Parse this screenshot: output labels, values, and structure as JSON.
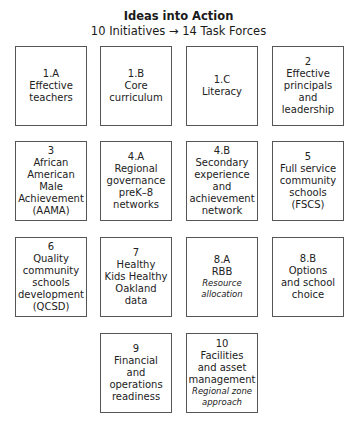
{
  "header": {
    "title": "Ideas into Action",
    "subtitle": "10 Initiatives → 14 Task Forces"
  },
  "boxes": [
    {
      "id": "1.A",
      "lines": [
        "Effective",
        "teachers"
      ],
      "note": []
    },
    {
      "id": "1.B",
      "lines": [
        "Core",
        "curriculum"
      ],
      "note": []
    },
    {
      "id": "1.C",
      "lines": [
        "Literacy"
      ],
      "note": []
    },
    {
      "id": "2",
      "lines": [
        "Effective",
        "principals",
        "and",
        "leadership"
      ],
      "note": []
    },
    {
      "id": "3",
      "lines": [
        "African",
        "American",
        "Male",
        "Achievement",
        "(AAMA)"
      ],
      "note": []
    },
    {
      "id": "4.A",
      "lines": [
        "Regional",
        "governance",
        "preK–8",
        "networks"
      ],
      "note": []
    },
    {
      "id": "4.B",
      "lines": [
        "Secondary",
        "experience",
        "and",
        "achievement",
        "network"
      ],
      "note": []
    },
    {
      "id": "5",
      "lines": [
        "Full service",
        "community",
        "schools",
        "(FSCS)"
      ],
      "note": []
    },
    {
      "id": "6",
      "lines": [
        "Quality",
        "community",
        "schools",
        "development",
        "(QCSD)"
      ],
      "note": []
    },
    {
      "id": "7",
      "lines": [
        "Healthy",
        "Kids Healthy",
        "Oakland",
        "data"
      ],
      "note": []
    },
    {
      "id": "8.A",
      "lines": [
        "RBB"
      ],
      "note": [
        "Resource",
        "allocation"
      ]
    },
    {
      "id": "8.B",
      "lines": [
        "Options",
        "and school",
        "choice"
      ],
      "note": []
    },
    {
      "id": "9",
      "lines": [
        "Financial",
        "and",
        "operations",
        "readiness"
      ],
      "note": []
    },
    {
      "id": "10",
      "lines": [
        "Facilities",
        "and asset",
        "management"
      ],
      "note": [
        "Regional zone",
        "approach"
      ]
    }
  ]
}
